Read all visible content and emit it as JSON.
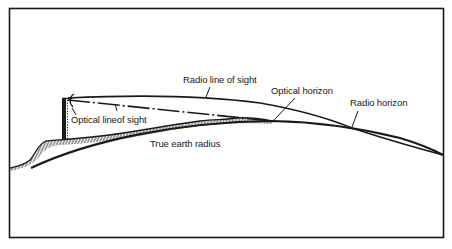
{
  "diagram": {
    "colors": {
      "background": "#ffffff",
      "ink": "#1a1a1a"
    },
    "labels": {
      "radio_line_of_sight": "Radio line of sight",
      "optical_horizon": "Optical horizon",
      "radio_horizon": "Radio horizon",
      "optical_line_of_sight": "Optical lineof sight",
      "true_earth_radius": "True earth radius"
    },
    "elements": [
      {
        "name": "antenna-tower",
        "kind": "structure"
      },
      {
        "name": "radio-line-of-sight",
        "kind": "curve",
        "style": "solid"
      },
      {
        "name": "optical-line-of-sight",
        "kind": "line",
        "style": "dash-dot"
      },
      {
        "name": "true-earth-radius",
        "kind": "curve",
        "style": "solid"
      },
      {
        "name": "terrain",
        "kind": "hatched-ground"
      }
    ]
  }
}
